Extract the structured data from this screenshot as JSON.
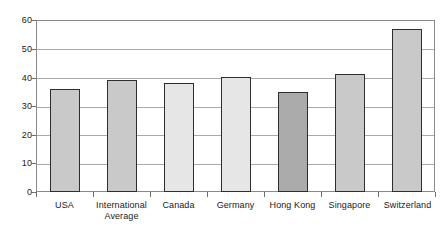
{
  "chart_data": {
    "type": "bar",
    "title": "",
    "subtitle": "",
    "xlabel": "",
    "ylabel": "",
    "ylim": [
      0,
      60
    ],
    "ytick_labels": [
      "60",
      "50",
      "40",
      "30",
      "20",
      "10",
      "0"
    ],
    "ytick_values": [
      60,
      50,
      40,
      30,
      20,
      10,
      0
    ],
    "grid": true,
    "legend": "none",
    "categories": [
      "USA",
      "International Average",
      "Canada",
      "Germany",
      "Hong Kong",
      "Singapore",
      "Switzerland"
    ],
    "category_lines": [
      [
        "USA"
      ],
      [
        "International",
        "Average"
      ],
      [
        "Canada"
      ],
      [
        "Germany"
      ],
      [
        "Hong Kong"
      ],
      [
        "Singapore"
      ],
      [
        "Switzerland"
      ]
    ],
    "values": [
      36,
      39,
      38,
      40,
      35,
      41,
      57
    ],
    "bar_colors": [
      "#c9c9c9",
      "#c9c9c9",
      "#e6e6e6",
      "#e6e6e6",
      "#ababab",
      "#c9c9c9",
      "#c9c9c9"
    ],
    "bar_border_color": "#2e2e2e",
    "gridline_color": "#a9a9a9",
    "axis_color": "#8a8a8a",
    "background": "#ffffff"
  }
}
